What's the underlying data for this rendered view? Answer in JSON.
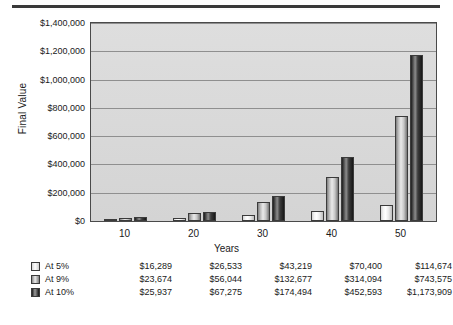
{
  "chart_data": {
    "type": "bar",
    "title": "",
    "xlabel": "Years",
    "ylabel": "Final Value",
    "categories": [
      "10",
      "20",
      "30",
      "40",
      "50"
    ],
    "ylim": [
      0,
      1400000
    ],
    "ytick_values": [
      0,
      200000,
      400000,
      600000,
      800000,
      1000000,
      1200000,
      1400000
    ],
    "ytick_labels": [
      "$0",
      "$200,000",
      "$400,000",
      "$600,000",
      "$800,000",
      "$1,000,000",
      "$1,200,000",
      "$1,400,000"
    ],
    "grid": true,
    "legend_position": "below-left",
    "series": [
      {
        "name": "At 5%",
        "values": [
          16289,
          23674,
          43219,
          70400,
          114674
        ],
        "labels": [
          "$16,289",
          "$26,533",
          "$43,219",
          "$70,400",
          "$114,674"
        ],
        "color": "#f2f2f2"
      },
      {
        "name": "At 9%",
        "values": [
          23674,
          56044,
          132677,
          314094,
          743575
        ],
        "labels": [
          "$23,674",
          "$56,044",
          "$132,677",
          "$314,094",
          "$743,575"
        ],
        "color": "#a8a8a8"
      },
      {
        "name": "At 10%",
        "values": [
          25937,
          67275,
          174494,
          452593,
          1173909
        ],
        "labels": [
          "$25,937",
          "$67,275",
          "$174,494",
          "$452,593",
          "$1,173,909"
        ],
        "color": "#2b2b2b"
      }
    ]
  },
  "chart": {
    "y_axis_title": "Final Value",
    "x_axis_title": "Years",
    "y_ticks": [
      "$1,400,000",
      "$1,200,000",
      "$1,000,000",
      "$800,000",
      "$600,000",
      "$400,000",
      "$200,000",
      "$0"
    ],
    "x_ticks": [
      "10",
      "20",
      "30",
      "40",
      "50"
    ]
  },
  "table": {
    "rows": [
      {
        "series": "At 5%",
        "values": [
          "$16,289",
          "$26,533",
          "$43,219",
          "$70,400",
          "$114,674"
        ]
      },
      {
        "series": "At 9%",
        "values": [
          "$23,674",
          "$56,044",
          "$132,677",
          "$314,094",
          "$743,575"
        ]
      },
      {
        "series": "At 10%",
        "values": [
          "$25,937",
          "$67,275",
          "$174,494",
          "$452,593",
          "$1,173,909"
        ]
      }
    ]
  }
}
